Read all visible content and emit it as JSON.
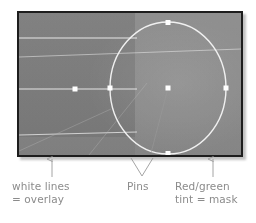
{
  "figure": {
    "kind": "annotated-screenshot-diagram",
    "panel": {
      "description": "grayscale photo preview with overlay lines, elliptical mask and pins",
      "border_color": "#1d1d1d",
      "base_color": "#868686",
      "tint_color": "rgba(40,40,40,0.085)"
    },
    "overlay": {
      "line_color": "#f2f2f2",
      "ellipse_color": "#f5f5f5",
      "pin_color": "#ffffff",
      "line_count": 4,
      "pin_count": 6
    }
  },
  "annotations": {
    "overlay_label": "white lines\n= overlay",
    "pins_label": "Pins",
    "mask_label": "Red/green\ntint = mask"
  },
  "styles": {
    "caption_color": "#8b8b8b",
    "leader_color": "#9a9a9a"
  }
}
